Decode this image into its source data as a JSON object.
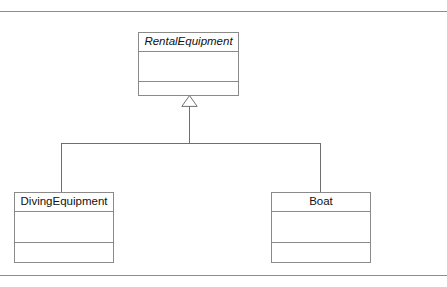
{
  "diagram": {
    "type": "uml-class-diagram",
    "relationship": "generalization",
    "base_class": {
      "name": "RentalEquipment",
      "abstract": true,
      "attributes": [],
      "operations": []
    },
    "subclasses": [
      {
        "name": "DivingEquipment",
        "abstract": false,
        "attributes": [],
        "operations": []
      },
      {
        "name": "Boat",
        "abstract": false,
        "attributes": [],
        "operations": []
      }
    ],
    "connector": {
      "arrowhead": "hollow-triangle",
      "routing": "shared-target-tree"
    },
    "colors": {
      "line": "#8a8a8a",
      "connector": "#6f6f6f",
      "rule": "#8d8d8d",
      "text": "#111111",
      "fill": "#ffffff"
    }
  }
}
